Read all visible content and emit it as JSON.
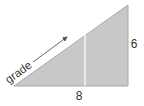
{
  "diagram": {
    "type": "right-triangle",
    "labels": {
      "hypotenuse": "grade",
      "base": "8",
      "height": "6"
    },
    "colors": {
      "fill": "#c8c8c8",
      "edge": "#9a9a9a",
      "divider": "#ffffff",
      "arrow": "#555555",
      "text": "#333333"
    }
  }
}
